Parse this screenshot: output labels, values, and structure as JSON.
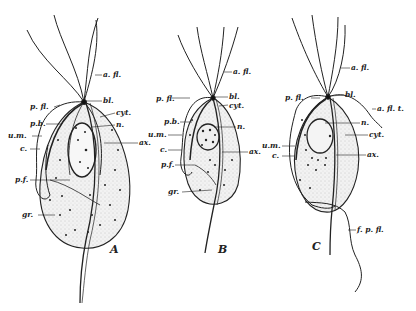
{
  "figure": {
    "panels": [
      {
        "id": "A",
        "letter": "A",
        "labels": {
          "a_fl": "a. fl.",
          "bl": "bl.",
          "cyt": "cyt.",
          "n": "n.",
          "ax": "ax.",
          "p_fl": "p. fl.",
          "p_b": "p.b.",
          "u_m": "u.m.",
          "c": "c.",
          "p_f": "p.f.",
          "gr": "gr."
        }
      },
      {
        "id": "B",
        "letter": "B",
        "labels": {
          "a_fl": "a. fl.",
          "bl": "bl.",
          "cyt": "cyt.",
          "n": "n.",
          "ax": "ax.",
          "p_fl": "p. fl.",
          "p_b": "p.b.",
          "u_m": "u.m.",
          "c": "c.",
          "p_f": "p.f.",
          "gr": "gr."
        }
      },
      {
        "id": "C",
        "letter": "C",
        "labels": {
          "a_fl": "a. fl.",
          "bl": "bl.",
          "a_fl_t": "a. fl. t.",
          "n": "n.",
          "cyt": "cyt.",
          "ax": "ax.",
          "p_fl": "p. fl.",
          "u_m": "u.m.",
          "c": "c.",
          "f_p_fl": "f. p. fl."
        }
      }
    ]
  },
  "colors": {
    "ink": "#222222",
    "stipple": "#bdbdbd",
    "background": "#ffffff"
  }
}
